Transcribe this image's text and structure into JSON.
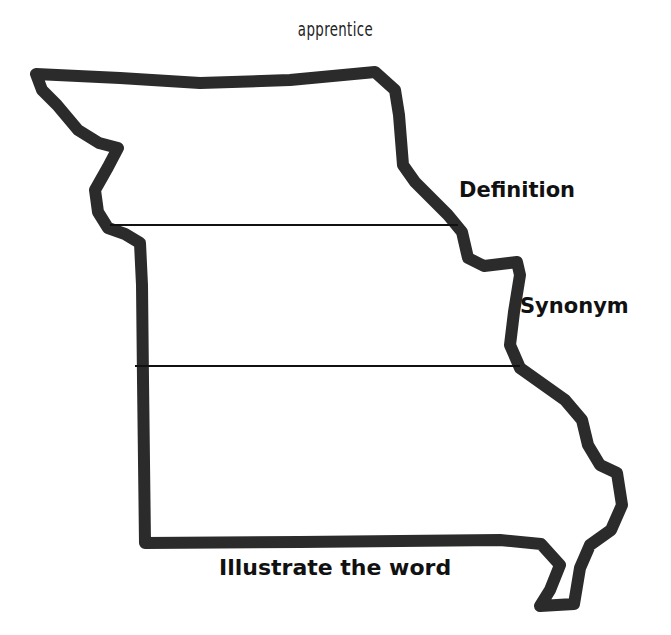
{
  "worksheet": {
    "word": "apprentice",
    "shape": "Missouri state outline",
    "sections": [
      {
        "id": "definition",
        "label": "Definition"
      },
      {
        "id": "synonym",
        "label": "Synonym"
      },
      {
        "id": "illustration",
        "label": "Illustrate the word"
      }
    ],
    "colors": {
      "outline": "#2b2b2b",
      "divider": "#111111",
      "text": "#111111",
      "background": "#ffffff"
    }
  }
}
